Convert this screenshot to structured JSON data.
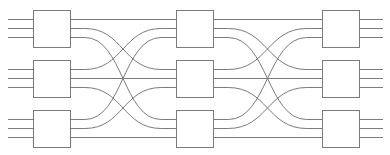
{
  "diagram": {
    "type": "multistage-interconnection-network",
    "canvas": {
      "width": 390,
      "height": 155,
      "background": "#ffffff"
    },
    "style": {
      "line_color": "#7b7b7b",
      "box_stroke": "#7b7b7b",
      "box_fill": "#ffffff",
      "line_width": 1
    },
    "geometry": {
      "box_width": 37,
      "box_height": 37,
      "stage_x": [
        33,
        176,
        322
      ],
      "row_y_top": [
        10,
        60,
        110
      ],
      "port_offsets": [
        9,
        18,
        27
      ],
      "input_stub_start_x": 8,
      "output_stub_end_x": 383
    },
    "stages": [
      {
        "index": 0,
        "name": "ingress-stage",
        "switch_count": 3,
        "switch_size": "3x3",
        "switches": [
          {
            "id": "s0-0",
            "row": 0,
            "inputs": 3,
            "outputs": 3
          },
          {
            "id": "s0-1",
            "row": 1,
            "inputs": 3,
            "outputs": 3
          },
          {
            "id": "s0-2",
            "row": 2,
            "inputs": 3,
            "outputs": 3
          }
        ]
      },
      {
        "index": 1,
        "name": "middle-stage",
        "switch_count": 3,
        "switch_size": "3x3",
        "switches": [
          {
            "id": "s1-0",
            "row": 0,
            "inputs": 3,
            "outputs": 3
          },
          {
            "id": "s1-1",
            "row": 1,
            "inputs": 3,
            "outputs": 3
          },
          {
            "id": "s1-2",
            "row": 2,
            "inputs": 3,
            "outputs": 3
          }
        ]
      },
      {
        "index": 2,
        "name": "egress-stage",
        "switch_count": 3,
        "switch_size": "3x3",
        "switches": [
          {
            "id": "s2-0",
            "row": 0,
            "inputs": 3,
            "outputs": 3
          },
          {
            "id": "s2-1",
            "row": 1,
            "inputs": 3,
            "outputs": 3
          },
          {
            "id": "s2-2",
            "row": 2,
            "inputs": 3,
            "outputs": 3
          }
        ]
      }
    ],
    "links": {
      "pattern": "perfect-shuffle",
      "description": "output port j of switch i connects to input port i of switch j",
      "stage0_to_stage1": [
        {
          "from_switch": 0,
          "from_port": 0,
          "to_switch": 0,
          "to_port": 0
        },
        {
          "from_switch": 0,
          "from_port": 1,
          "to_switch": 1,
          "to_port": 0
        },
        {
          "from_switch": 0,
          "from_port": 2,
          "to_switch": 2,
          "to_port": 0
        },
        {
          "from_switch": 1,
          "from_port": 0,
          "to_switch": 0,
          "to_port": 1
        },
        {
          "from_switch": 1,
          "from_port": 1,
          "to_switch": 1,
          "to_port": 1
        },
        {
          "from_switch": 1,
          "from_port": 2,
          "to_switch": 2,
          "to_port": 1
        },
        {
          "from_switch": 2,
          "from_port": 0,
          "to_switch": 0,
          "to_port": 2
        },
        {
          "from_switch": 2,
          "from_port": 1,
          "to_switch": 1,
          "to_port": 2
        },
        {
          "from_switch": 2,
          "from_port": 2,
          "to_switch": 2,
          "to_port": 2
        }
      ],
      "stage1_to_stage2": [
        {
          "from_switch": 0,
          "from_port": 0,
          "to_switch": 0,
          "to_port": 0
        },
        {
          "from_switch": 0,
          "from_port": 1,
          "to_switch": 1,
          "to_port": 0
        },
        {
          "from_switch": 0,
          "from_port": 2,
          "to_switch": 2,
          "to_port": 0
        },
        {
          "from_switch": 1,
          "from_port": 0,
          "to_switch": 0,
          "to_port": 1
        },
        {
          "from_switch": 1,
          "from_port": 1,
          "to_switch": 1,
          "to_port": 1
        },
        {
          "from_switch": 1,
          "from_port": 2,
          "to_switch": 2,
          "to_port": 1
        },
        {
          "from_switch": 2,
          "from_port": 0,
          "to_switch": 0,
          "to_port": 2
        },
        {
          "from_switch": 2,
          "from_port": 1,
          "to_switch": 1,
          "to_port": 2
        },
        {
          "from_switch": 2,
          "from_port": 2,
          "to_switch": 2,
          "to_port": 2
        }
      ]
    },
    "external_ports": {
      "input_count": 9,
      "output_count": 9
    }
  }
}
